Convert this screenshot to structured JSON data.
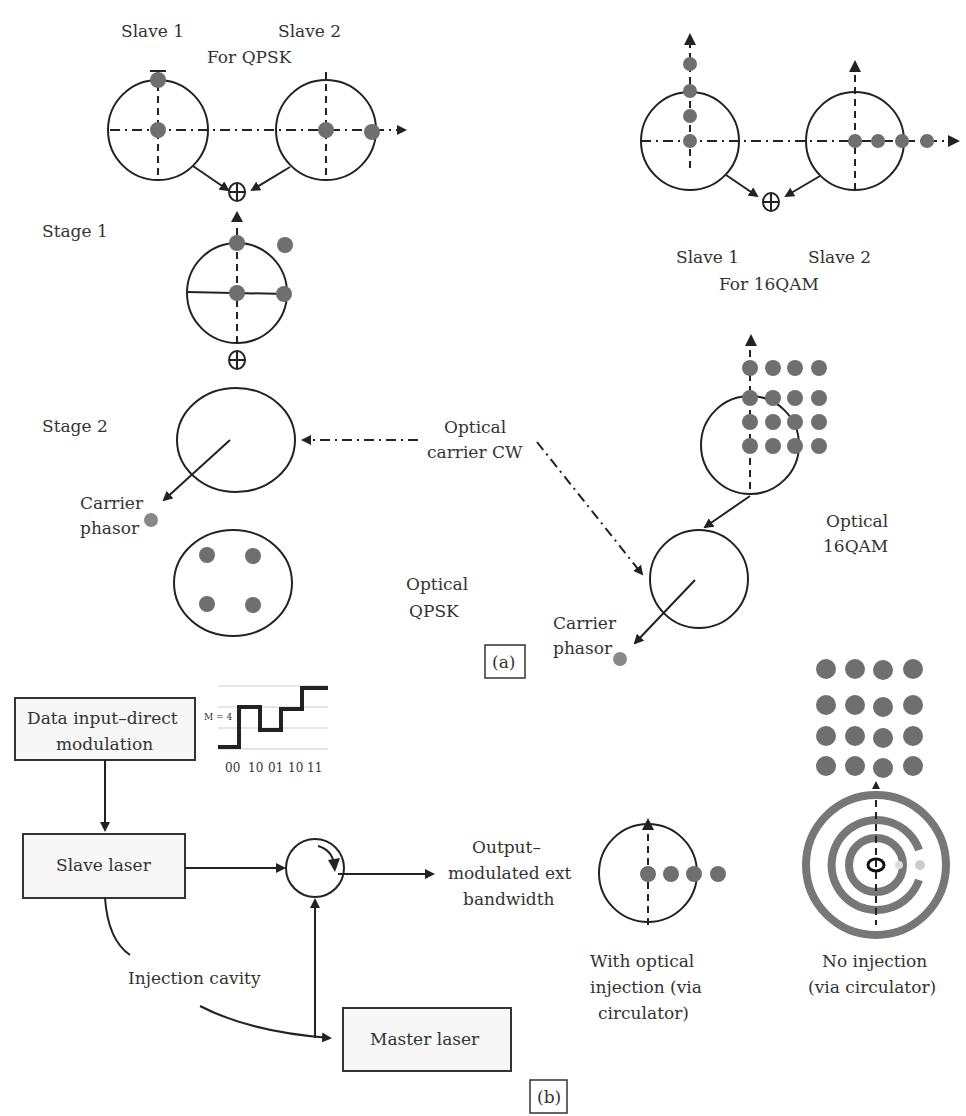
{
  "panel_a": {
    "qpsk_header": {
      "slave1": "Slave  1",
      "slave2": "Slave 2",
      "for": "For QPSK"
    },
    "qam_header": {
      "slave1": "Slave  1",
      "slave2": "Slave 2",
      "for": "For 16QAM"
    },
    "stage1": "Stage 1",
    "stage2": "Stage 2",
    "optical_carrier": {
      "line1": "Optical",
      "line2": "carrier CW"
    },
    "carrier_phasor_left": {
      "line1": "Carrier",
      "line2": "phasor"
    },
    "carrier_phasor_right": {
      "line1": "Carrier",
      "line2": "phasor"
    },
    "optical_qpsk": {
      "line1": "Optical",
      "line2": "QPSK"
    },
    "optical_16qam": {
      "line1": "Optical",
      "line2": "16QAM"
    },
    "label": "(a)",
    "adder_symbol": "⊕",
    "dot_color": "#6f6f6f"
  },
  "panel_b": {
    "data_input_box": {
      "line1": "Data input–direct",
      "line2": "modulation"
    },
    "waveform": {
      "level_label": "M = 4",
      "symbols": [
        "00",
        "10",
        "01",
        "10",
        "11"
      ]
    },
    "slave_laser": "Slave laser",
    "master_laser": "Master laser",
    "injection_cavity": "Injection cavity",
    "output": {
      "line1": "Output–",
      "line2": "modulated ext",
      "line3": "bandwidth"
    },
    "with_injection": {
      "line1": "With optical",
      "line2": "injection (via",
      "line3": "circulator)"
    },
    "no_injection": {
      "line1": "No injection",
      "line2": "(via circulator)"
    },
    "label": "(b)"
  }
}
